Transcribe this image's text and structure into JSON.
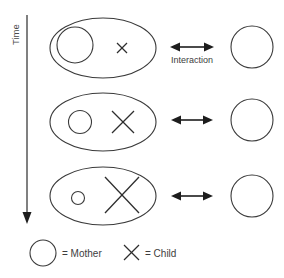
{
  "diagram": {
    "axis": {
      "label": "Time",
      "direction": "downward"
    },
    "interaction_label": "Interaction",
    "colors": {
      "stroke": "#3a3a3a",
      "arrow": "#1d1d1d",
      "text": "#3d3d3d",
      "background": "#ffffff"
    },
    "rows": [
      {
        "index": 1,
        "dyad_shape": "ellipse",
        "mother_size": "large",
        "child_size": "small",
        "has_interaction_label": true
      },
      {
        "index": 2,
        "dyad_shape": "ellipse",
        "mother_size": "medium",
        "child_size": "medium",
        "has_interaction_label": false
      },
      {
        "index": 3,
        "dyad_shape": "ellipse",
        "mother_size": "small",
        "child_size": "large",
        "has_interaction_label": false
      }
    ],
    "legend": [
      {
        "symbol": "circle",
        "text": "= Mother"
      },
      {
        "symbol": "x",
        "text": "= Child"
      }
    ]
  }
}
